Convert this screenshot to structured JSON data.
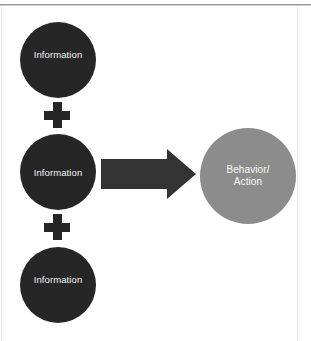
{
  "diagram": {
    "canvas": {
      "width": 311,
      "height": 341,
      "background": "#ffffff"
    },
    "colors": {
      "input_node": "#262626",
      "output_node": "#8c8c8c",
      "arrow": "#333333",
      "node_text": "#f2f2f2",
      "rule": "#9a9a9a"
    },
    "inputs": [
      {
        "label": "Information"
      },
      {
        "label": "Information"
      },
      {
        "label": "Information"
      }
    ],
    "operators": [
      {
        "symbol": "+",
        "name": "plus"
      },
      {
        "symbol": "+",
        "name": "plus"
      }
    ],
    "connector": {
      "name": "right-arrow",
      "direction": "right"
    },
    "output": {
      "line1": "Behavior/",
      "line2": "Action"
    }
  }
}
